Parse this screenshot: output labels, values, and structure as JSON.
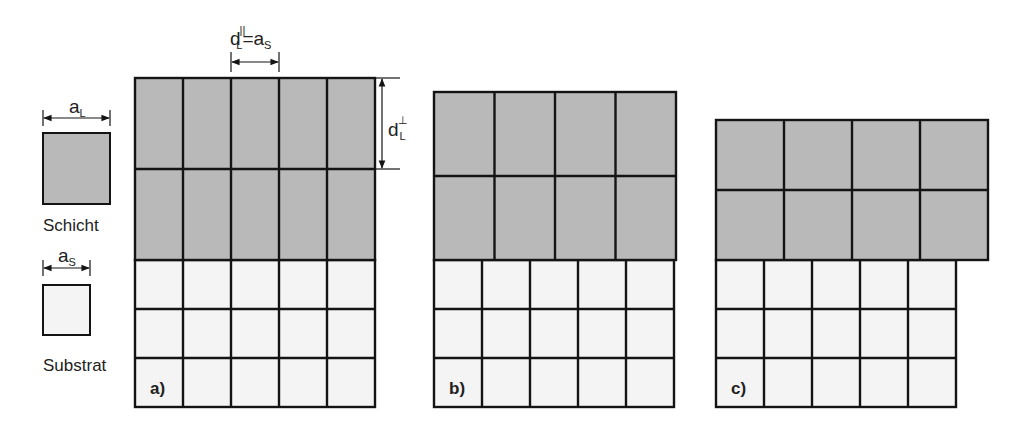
{
  "colors": {
    "layer_fill": "#b9b9b9",
    "substrate_fill": "#f4f4f4",
    "line": "#141414",
    "text": "#222222"
  },
  "legend": {
    "layer": {
      "dimension_symbol": "a",
      "dimension_subscript": "L",
      "label": "Schicht"
    },
    "substrate": {
      "dimension_symbol": "a",
      "dimension_subscript": "S",
      "label": "Substrat"
    }
  },
  "annotations": {
    "parallel": {
      "symbol": "d",
      "superscript": "||",
      "subscript": "L",
      "equals": "=a",
      "equals_subscript": "S"
    },
    "perpendicular": {
      "symbol": "d",
      "superscript": "⊥",
      "subscript": "L"
    }
  },
  "panels": [
    {
      "label": "a)",
      "layer": {
        "x": 135,
        "y": 78,
        "cols": 5,
        "rows": 2,
        "cell_w": 48,
        "cell_h": 91
      },
      "substrate": {
        "x": 135,
        "y": 260,
        "cols": 5,
        "rows": 3,
        "cell_w": 48,
        "cell_h": 49
      }
    },
    {
      "label": "b)",
      "layer": {
        "x": 434,
        "y": 92,
        "cols": 4,
        "rows": 2,
        "cell_w": 60.5,
        "cell_h": 84
      },
      "substrate": {
        "x": 434,
        "y": 260,
        "cols": 5,
        "rows": 3,
        "cell_w": 48,
        "cell_h": 49
      }
    },
    {
      "label": "c)",
      "layer": {
        "x": 716,
        "y": 120,
        "cols": 4,
        "rows": 2,
        "cell_w": 68,
        "cell_h": 70
      },
      "substrate": {
        "x": 716,
        "y": 260,
        "cols": 5,
        "rows": 3,
        "cell_w": 48,
        "cell_h": 49
      }
    }
  ]
}
